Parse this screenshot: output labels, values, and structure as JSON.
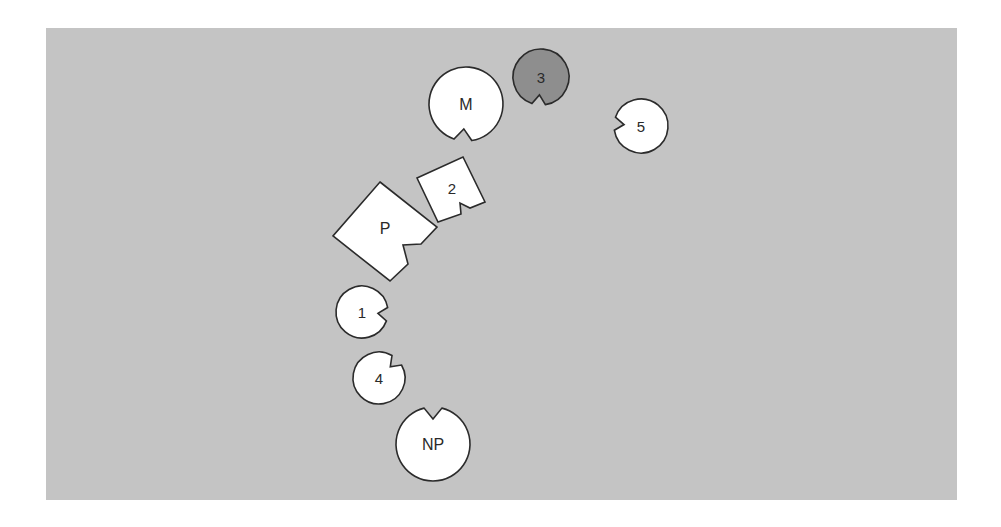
{
  "diagram": {
    "background": {
      "x": 46,
      "y": 28,
      "width": 911,
      "height": 472,
      "color": "#c4c4c4"
    },
    "squares": [
      {
        "id": "P",
        "label": "P",
        "fill": "#ffffff",
        "font_size": 16,
        "label_pos": [
          385,
          228
        ],
        "points": [
          [
            380,
            182
          ],
          [
            437,
            227
          ],
          [
            421,
            244
          ],
          [
            403,
            245
          ],
          [
            408,
            264
          ],
          [
            390,
            281
          ],
          [
            333,
            236
          ]
        ]
      },
      {
        "id": "2",
        "label": "2",
        "fill": "#ffffff",
        "font_size": 15,
        "label_pos": [
          452,
          188
        ],
        "points": [
          [
            417,
            178
          ],
          [
            463,
            157
          ],
          [
            485,
            202
          ],
          [
            470,
            208
          ],
          [
            460,
            203
          ],
          [
            461,
            214
          ],
          [
            438,
            222
          ]
        ]
      }
    ],
    "circles": [
      {
        "id": "M",
        "label": "M",
        "cx": 466,
        "cy": 104,
        "r": 37,
        "notch_angle": 95,
        "notch_depth": 12,
        "notch_half": 14,
        "fill": "#ffffff",
        "font_size": 16
      },
      {
        "id": "3",
        "label": "3",
        "cx": 541,
        "cy": 77,
        "r": 28,
        "notch_angle": 95,
        "notch_depth": 10,
        "notch_half": 14,
        "fill": "#8e8e8e",
        "font_size": 15
      },
      {
        "id": "5",
        "label": "5",
        "cx": 641,
        "cy": 126,
        "r": 27,
        "notch_angle": 185,
        "notch_depth": 10,
        "notch_half": 14,
        "fill": "#ffffff",
        "font_size": 15
      },
      {
        "id": "1",
        "label": "1",
        "cx": 362,
        "cy": 312,
        "r": 26,
        "notch_angle": 5,
        "notch_depth": 10,
        "notch_half": 15,
        "fill": "#ffffff",
        "font_size": 15
      },
      {
        "id": "4",
        "label": "4",
        "cx": 379,
        "cy": 378,
        "r": 26,
        "notch_angle": -45,
        "notch_depth": 10,
        "notch_half": 15,
        "fill": "#ffffff",
        "font_size": 15
      },
      {
        "id": "NP",
        "label": "NP",
        "cx": 433,
        "cy": 444,
        "r": 37,
        "notch_angle": -90,
        "notch_depth": 12,
        "notch_half": 14,
        "fill": "#ffffff",
        "font_size": 16
      }
    ]
  }
}
